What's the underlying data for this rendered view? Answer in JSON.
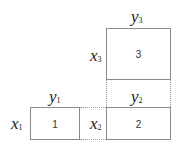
{
  "diagram": {
    "boxes": [
      {
        "id": "1",
        "label": "1",
        "row": "x1",
        "col": "y1"
      },
      {
        "id": "2",
        "label": "2",
        "row": "x2",
        "col": "y2"
      },
      {
        "id": "3",
        "label": "3",
        "row": "x3",
        "col": "y3"
      }
    ],
    "labels": {
      "y1": {
        "base": "y",
        "sub": "1"
      },
      "y2": {
        "base": "y",
        "sub": "2"
      },
      "y3": {
        "base": "y",
        "sub": "3"
      },
      "x1": {
        "base": "x",
        "sub": "1"
      },
      "x2": {
        "base": "x",
        "sub": "2"
      },
      "x3": {
        "base": "x",
        "sub": "3"
      }
    },
    "colors": {
      "border": "#8a8a8a",
      "dotted": "#9a9a9a",
      "text": "#222222"
    }
  }
}
